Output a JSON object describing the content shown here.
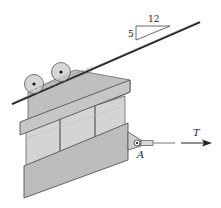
{
  "diagram": {
    "slope": {
      "run": "12",
      "rise": "5"
    },
    "force_label": "T",
    "point_label": "A",
    "colors": {
      "plate": "#bdbdbd",
      "plate_dark": "#a9a9a9",
      "bar": "#c8c8c8",
      "window": "#d6d6d6",
      "outline": "#555555",
      "cable": "#222222"
    }
  }
}
